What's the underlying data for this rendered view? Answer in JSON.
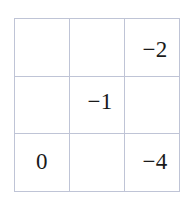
{
  "figure": {
    "kind": "3x3-grid",
    "rows": 3,
    "columns": 3,
    "border_color": "#bfc4d6",
    "background_color": "#ffffff",
    "text_color": "#1a1a1a"
  },
  "chart_data": {
    "type": "table",
    "title": "",
    "xlabel": "",
    "ylabel": "",
    "rows": 3,
    "columns": 3,
    "cells": [
      [
        "",
        "",
        "−2"
      ],
      [
        "",
        "−1",
        ""
      ],
      [
        "0",
        "",
        "−4"
      ]
    ],
    "values": [
      [
        null,
        null,
        -2
      ],
      [
        null,
        -1,
        null
      ],
      [
        0,
        null,
        -4
      ]
    ]
  }
}
